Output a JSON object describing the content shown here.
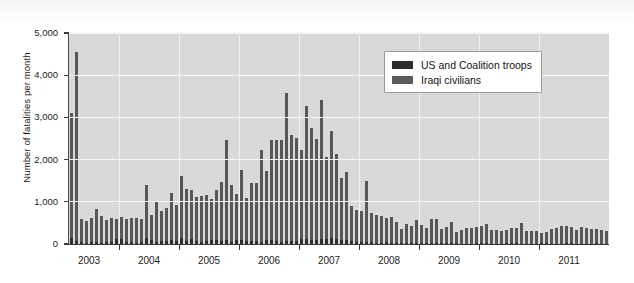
{
  "chart_data": {
    "type": "bar",
    "title": "",
    "subtitle": "",
    "xlabel": "",
    "ylabel": "Number of fatalities per month",
    "ylim": [
      0,
      5000
    ],
    "ytick_labels": [
      "0",
      "1,000",
      "2,000",
      "3,000",
      "4,000",
      "5,000"
    ],
    "ytick_values": [
      0,
      1000,
      2000,
      3000,
      4000,
      5000
    ],
    "xtick_labels": [
      "2003",
      "2004",
      "2005",
      "2006",
      "2007",
      "2008",
      "2009",
      "2010",
      "2011"
    ],
    "grid": "horizontal-and-vertical-white",
    "legend_position": "top-right-inside",
    "stacked": true,
    "x_start": "2003-03",
    "x_end": "2011-12",
    "series": [
      {
        "name": "US and Coalition troops",
        "color": "#2e2e2e",
        "values": [
          140,
          80,
          45,
          35,
          55,
          50,
          35,
          45,
          45,
          115,
          110,
          50,
          50,
          30,
          55,
          145,
          85,
          45,
          60,
          70,
          85,
          70,
          145,
          80,
          130,
          65,
          45,
          60,
          90,
          85,
          65,
          90,
          55,
          105,
          100,
          75,
          70,
          60,
          50,
          85,
          85,
          65,
          50,
          75,
          80,
          65,
          120,
          130,
          90,
          90,
          120,
          115,
          135,
          110,
          90,
          90,
          75,
          45,
          45,
          40,
          45,
          30,
          30,
          55,
          30,
          30,
          25,
          30,
          30,
          20,
          20,
          25,
          30,
          20,
          15,
          20,
          25,
          25,
          10,
          10,
          10,
          15,
          15,
          20,
          10,
          10,
          10,
          20,
          20,
          15,
          5,
          10,
          10,
          10,
          15,
          15,
          10,
          10,
          10,
          15,
          15,
          10,
          10,
          5,
          10,
          15,
          10,
          10
        ]
      },
      {
        "name": "Iraqi civilians",
        "color": "#575757",
        "values": [
          2960,
          4470,
          540,
          510,
          555,
          790,
          620,
          520,
          570,
          485,
          520,
          540,
          560,
          580,
          545,
          1250,
          610,
          950,
          730,
          780,
          1135,
          855,
          1465,
          1215,
          1160,
          1040,
          1095,
          1090,
          985,
          1195,
          1405,
          2380,
          1340,
          1085,
          1645,
          1010,
          1385,
          1390,
          2170,
          1655,
          2390,
          2400,
          2415,
          3510,
          2495,
          2450,
          2110,
          3150,
          2660,
          2400,
          3300,
          1940,
          2545,
          2020,
          1480,
          1610,
          835,
          770,
          740,
          1455,
          685,
          665,
          630,
          560,
          600,
          490,
          320,
          445,
          390,
          555,
          420,
          345,
          555,
          565,
          345,
          380,
          500,
          260,
          320,
          360,
          370,
          385,
          410,
          455,
          330,
          320,
          300,
          320,
          360,
          370,
          500,
          290,
          290,
          300,
          255,
          265,
          350,
          380,
          420,
          405,
          395,
          330,
          400,
          375,
          335,
          340,
          320,
          300
        ]
      }
    ]
  },
  "legend": {
    "items": [
      {
        "label": "US and Coalition troops",
        "swatch_class": "troops"
      },
      {
        "label": "Iraqi civilians",
        "swatch_class": "civ"
      }
    ]
  }
}
